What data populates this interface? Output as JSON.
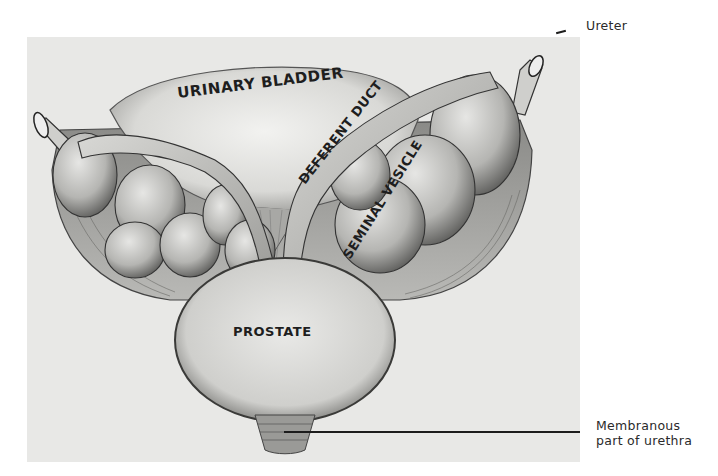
{
  "figure": {
    "background": "#ffffff",
    "panel_color": "#e8e8e6"
  },
  "structures": {
    "bladder": "URINARY BLADDER",
    "duct": "DEFERENT DUCT",
    "vesicle": "SEMINAL VESICLE",
    "prostate": "PROSTATE"
  },
  "callouts": {
    "ureter": "Ureter",
    "urethra_line1": "Membranous",
    "urethra_line2": "part of urethra"
  }
}
